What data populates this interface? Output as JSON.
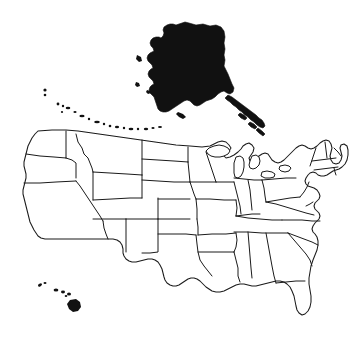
{
  "figure": {
    "title": "Map of the United States",
    "background_color": "#ffffff",
    "outline_color": "#1a1a1a",
    "fill_color": "#111111",
    "projection_note": "Alaska placed above the contiguous states, Hawaii placed at lower left"
  },
  "regions": [
    {
      "id": "contiguous-united-states",
      "label": "Contiguous United States",
      "style": "outlined",
      "fill": "#ffffff",
      "stroke": "#1a1a1a"
    },
    {
      "id": "alaska",
      "label": "Alaska",
      "style": "solid-filled",
      "fill": "#111111",
      "position": "top-center"
    },
    {
      "id": "aleutian-islands",
      "label": "Aleutian Islands",
      "style": "solid-filled",
      "fill": "#111111",
      "position": "upper-left-arc"
    },
    {
      "id": "hawaii",
      "label": "Hawaii",
      "style": "solid-filled",
      "fill": "#111111",
      "position": "lower-left"
    }
  ],
  "states": [
    {
      "code": "WA",
      "name": "Washington"
    },
    {
      "code": "OR",
      "name": "Oregon"
    },
    {
      "code": "CA",
      "name": "California"
    },
    {
      "code": "NV",
      "name": "Nevada"
    },
    {
      "code": "ID",
      "name": "Idaho"
    },
    {
      "code": "MT",
      "name": "Montana"
    },
    {
      "code": "WY",
      "name": "Wyoming"
    },
    {
      "code": "UT",
      "name": "Utah"
    },
    {
      "code": "AZ",
      "name": "Arizona"
    },
    {
      "code": "CO",
      "name": "Colorado"
    },
    {
      "code": "NM",
      "name": "New Mexico"
    },
    {
      "code": "ND",
      "name": "North Dakota"
    },
    {
      "code": "SD",
      "name": "South Dakota"
    },
    {
      "code": "NE",
      "name": "Nebraska"
    },
    {
      "code": "KS",
      "name": "Kansas"
    },
    {
      "code": "OK",
      "name": "Oklahoma"
    },
    {
      "code": "TX",
      "name": "Texas"
    },
    {
      "code": "MN",
      "name": "Minnesota"
    },
    {
      "code": "IA",
      "name": "Iowa"
    },
    {
      "code": "MO",
      "name": "Missouri"
    },
    {
      "code": "AR",
      "name": "Arkansas"
    },
    {
      "code": "LA",
      "name": "Louisiana"
    },
    {
      "code": "WI",
      "name": "Wisconsin"
    },
    {
      "code": "IL",
      "name": "Illinois"
    },
    {
      "code": "MI",
      "name": "Michigan"
    },
    {
      "code": "IN",
      "name": "Indiana"
    },
    {
      "code": "OH",
      "name": "Ohio"
    },
    {
      "code": "KY",
      "name": "Kentucky"
    },
    {
      "code": "TN",
      "name": "Tennessee"
    },
    {
      "code": "MS",
      "name": "Mississippi"
    },
    {
      "code": "AL",
      "name": "Alabama"
    },
    {
      "code": "GA",
      "name": "Georgia"
    },
    {
      "code": "FL",
      "name": "Florida"
    },
    {
      "code": "SC",
      "name": "South Carolina"
    },
    {
      "code": "NC",
      "name": "North Carolina"
    },
    {
      "code": "VA",
      "name": "Virginia"
    },
    {
      "code": "WV",
      "name": "West Virginia"
    },
    {
      "code": "MD",
      "name": "Maryland"
    },
    {
      "code": "DE",
      "name": "Delaware"
    },
    {
      "code": "PA",
      "name": "Pennsylvania"
    },
    {
      "code": "NJ",
      "name": "New Jersey"
    },
    {
      "code": "NY",
      "name": "New York"
    },
    {
      "code": "CT",
      "name": "Connecticut"
    },
    {
      "code": "RI",
      "name": "Rhode Island"
    },
    {
      "code": "MA",
      "name": "Massachusetts"
    },
    {
      "code": "VT",
      "name": "Vermont"
    },
    {
      "code": "NH",
      "name": "New Hampshire"
    },
    {
      "code": "ME",
      "name": "Maine"
    },
    {
      "code": "AK",
      "name": "Alaska"
    },
    {
      "code": "HI",
      "name": "Hawaii"
    }
  ]
}
